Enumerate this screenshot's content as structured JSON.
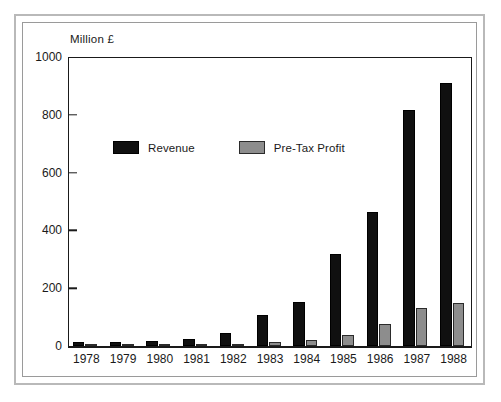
{
  "chart_data": {
    "type": "bar",
    "title": "",
    "subtitle": "",
    "unit_label": "Million £",
    "xlabel": "",
    "ylabel": "",
    "categories": [
      "1978",
      "1979",
      "1980",
      "1981",
      "1982",
      "1983",
      "1984",
      "1985",
      "1986",
      "1987",
      "1988"
    ],
    "series": [
      {
        "name": "Revenue",
        "color": "#101010",
        "values": [
          14,
          14,
          18,
          24,
          44,
          108,
          152,
          318,
          465,
          815,
          910
        ]
      },
      {
        "name": "Pre-Tax Profit",
        "color": "#8d8d8d",
        "values": [
          1,
          1,
          2,
          3,
          7,
          15,
          21,
          39,
          75,
          133,
          148
        ]
      }
    ],
    "ylim": [
      0,
      1000
    ],
    "yticks": [
      0,
      200,
      400,
      600,
      800,
      1000
    ],
    "ytick_labels": [
      "0",
      "200",
      "400",
      "600",
      "800",
      "1000"
    ],
    "grid": false,
    "legend_position": "inside-upper-left",
    "bar_orientation": "vertical"
  },
  "legend": {
    "items": [
      {
        "label": "Revenue",
        "swatch": "black-square"
      },
      {
        "label": "Pre-Tax Profit",
        "swatch": "gray-square"
      }
    ]
  },
  "colors": {
    "revenue": "#101010",
    "profit": "#8d8d8d",
    "axis": "#1a1a1a",
    "frame_outer": "#b9b9b9",
    "frame_inner": "#9a9a9a",
    "background": "#ffffff"
  }
}
